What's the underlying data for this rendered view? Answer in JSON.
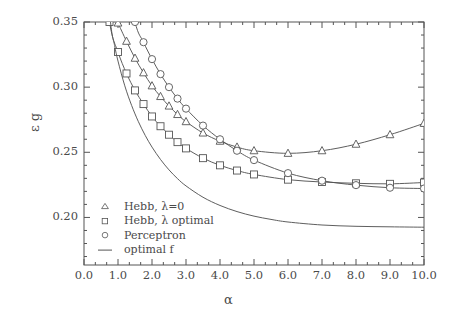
{
  "chart_data": {
    "type": "line",
    "title": "",
    "xlabel": "α",
    "ylabel": "ε g",
    "xlim": [
      0.0,
      10.0
    ],
    "ylim": [
      0.1635,
      0.35
    ],
    "xticks": [
      "0.0",
      "1.0",
      "2.0",
      "3.0",
      "4.0",
      "5.0",
      "6.0",
      "7.0",
      "8.0",
      "9.0",
      "10.0"
    ],
    "xtick_values": [
      0,
      1,
      2,
      3,
      4,
      5,
      6,
      7,
      8,
      9,
      10
    ],
    "yticks": [
      "0.35",
      "0.30",
      "0.25",
      "0.20"
    ],
    "ytick_values": [
      0.35,
      0.3,
      0.25,
      0.2
    ],
    "minor_x_per_major": 2,
    "minor_y_per_major": 5,
    "grid": false,
    "legend_position": "lower-left-inside",
    "series": [
      {
        "name": "Hebb, λ=0",
        "marker": "triangle",
        "line": true,
        "x": [
          1.0,
          1.25,
          1.5,
          1.75,
          2.0,
          2.25,
          2.5,
          2.75,
          3.0,
          3.5,
          4.0,
          4.5,
          5.0,
          6.0,
          7.0,
          8.0,
          9.0,
          10.0
        ],
        "y": [
          0.3492,
          0.3352,
          0.3222,
          0.311,
          0.301,
          0.2928,
          0.2855,
          0.279,
          0.2735,
          0.2648,
          0.2585,
          0.254,
          0.2512,
          0.2492,
          0.2512,
          0.2562,
          0.2635,
          0.2722
        ]
      },
      {
        "name": "Hebb, λ optimal",
        "marker": "square",
        "line": true,
        "x": [
          0.75,
          1.0,
          1.25,
          1.5,
          1.75,
          2.0,
          2.25,
          2.5,
          2.75,
          3.0,
          3.5,
          4.0,
          4.5,
          5.0,
          6.0,
          7.0,
          8.0,
          9.0,
          10.0
        ],
        "y": [
          0.35,
          0.327,
          0.3105,
          0.2975,
          0.287,
          0.2775,
          0.27,
          0.2635,
          0.2578,
          0.253,
          0.2455,
          0.24,
          0.236,
          0.233,
          0.229,
          0.2272,
          0.2262,
          0.2258,
          0.2268
        ],
        "first_point_partial": true
      },
      {
        "name": "Perceptron",
        "marker": "circle",
        "line": true,
        "x": [
          1.5,
          1.75,
          2.0,
          2.25,
          2.5,
          2.75,
          3.0,
          3.5,
          4.0,
          4.5,
          5.0,
          6.0,
          7.0,
          8.0,
          9.0,
          10.0
        ],
        "y": [
          0.35,
          0.3345,
          0.3215,
          0.31,
          0.3,
          0.2912,
          0.2835,
          0.2705,
          0.26,
          0.2512,
          0.244,
          0.234,
          0.2282,
          0.2248,
          0.2228,
          0.2222
        ]
      },
      {
        "name": "optimal f",
        "marker": "none",
        "line": true,
        "x": [
          0.78,
          0.9,
          1.0,
          1.2,
          1.4,
          1.6,
          1.8,
          2.0,
          2.25,
          2.5,
          2.75,
          3.0,
          3.5,
          4.0,
          4.5,
          5.0,
          5.5,
          6.0,
          7.0,
          8.0,
          9.0,
          10.0
        ],
        "y": [
          0.35,
          0.332,
          0.32,
          0.301,
          0.286,
          0.2735,
          0.263,
          0.254,
          0.2445,
          0.2365,
          0.2298,
          0.2242,
          0.2155,
          0.2092,
          0.2045,
          0.201,
          0.1985,
          0.1965,
          0.1942,
          0.1932,
          0.1928,
          0.1925
        ]
      }
    ]
  },
  "legend": {
    "items": [
      {
        "symbol": "triangle",
        "label": "Hebb, λ=0"
      },
      {
        "symbol": "square",
        "label": "Hebb, λ optimal"
      },
      {
        "symbol": "circle",
        "label": "Perceptron"
      },
      {
        "symbol": "line",
        "label": "optimal f"
      }
    ]
  },
  "axes": {
    "x_axis_label": "α",
    "y_axis_label": "ε g"
  },
  "colors": {
    "line": "#555555",
    "axis": "#555555",
    "text": "#4a4a4a",
    "background": "#ffffff"
  }
}
